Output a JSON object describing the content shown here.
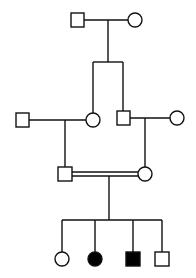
{
  "diagram": {
    "type": "pedigree",
    "colors": {
      "line": "#111111",
      "affected": "#000000",
      "unaffected": "#ffffff"
    },
    "generations": [
      {
        "label": "I",
        "individuals": [
          {
            "id": "I-1",
            "sex": "male",
            "affected": false
          },
          {
            "id": "I-2",
            "sex": "female",
            "affected": false
          }
        ]
      },
      {
        "label": "II",
        "individuals": [
          {
            "id": "II-1",
            "sex": "male",
            "affected": false,
            "role": "spouse"
          },
          {
            "id": "II-2",
            "sex": "female",
            "affected": false,
            "parents": "I"
          },
          {
            "id": "II-3",
            "sex": "male",
            "affected": false,
            "parents": "I"
          },
          {
            "id": "II-4",
            "sex": "female",
            "affected": false,
            "role": "spouse"
          }
        ]
      },
      {
        "label": "III",
        "individuals": [
          {
            "id": "III-1",
            "sex": "male",
            "affected": false
          },
          {
            "id": "III-2",
            "sex": "female",
            "affected": false
          }
        ],
        "mating": "consanguineous"
      },
      {
        "label": "IV",
        "individuals": [
          {
            "id": "IV-1",
            "sex": "female",
            "affected": false
          },
          {
            "id": "IV-2",
            "sex": "female",
            "affected": true
          },
          {
            "id": "IV-3",
            "sex": "male",
            "affected": true
          },
          {
            "id": "IV-4",
            "sex": "male",
            "affected": false
          }
        ]
      }
    ]
  }
}
